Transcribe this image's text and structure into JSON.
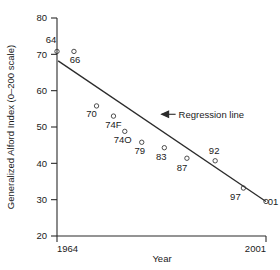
{
  "chart_data": {
    "type": "scatter",
    "title": "",
    "xlabel": "Year",
    "ylabel": "Generalized Alford Index (0–200 scale)",
    "xlim": [
      1964,
      2001
    ],
    "ylim": [
      20,
      80
    ],
    "xticks": [
      1964,
      2001
    ],
    "xtick_labels": [
      "1964",
      "2001"
    ],
    "yticks": [
      20,
      30,
      40,
      50,
      60,
      70,
      80
    ],
    "ytick_labels": [
      "20",
      "30",
      "40",
      "50",
      "60",
      "70",
      "80"
    ],
    "grid": false,
    "legend": "none",
    "points": [
      {
        "label": "64",
        "x": 1964,
        "y": 70.8,
        "label_dx": -6,
        "label_dy": -8
      },
      {
        "label": "66",
        "x": 1967,
        "y": 70.8,
        "label_dx": 1,
        "label_dy": 12
      },
      {
        "label": "70",
        "x": 1971,
        "y": 55.8,
        "label_dx": -5,
        "label_dy": 11
      },
      {
        "label": "74F",
        "x": 1974,
        "y": 53.0,
        "label_dx": 0,
        "label_dy": 12
      },
      {
        "label": "74O",
        "x": 1976,
        "y": 48.8,
        "label_dx": -2,
        "label_dy": 12
      },
      {
        "label": "79",
        "x": 1979,
        "y": 45.8,
        "label_dx": -2,
        "label_dy": 12
      },
      {
        "label": "83",
        "x": 1983,
        "y": 44.3,
        "label_dx": -3,
        "label_dy": 12
      },
      {
        "label": "87",
        "x": 1987,
        "y": 41.4,
        "label_dx": -5,
        "label_dy": 13
      },
      {
        "label": "92",
        "x": 1992,
        "y": 40.7,
        "label_dx": -1,
        "label_dy": -7
      },
      {
        "label": "97",
        "x": 1997,
        "y": 33.2,
        "label_dx": -8,
        "label_dy": 12
      },
      {
        "label": "01",
        "x": 2001,
        "y": 29.5,
        "label_dx": 7,
        "label_dy": 4
      }
    ],
    "regression_line": {
      "x_start": 1964.2,
      "y_start": 68.2,
      "x_end": 2001,
      "y_end": 29.5
    },
    "annotations": [
      {
        "name": "regression-line-annotation",
        "text": "Regression line",
        "x": 1985,
        "y": 53.5
      }
    ]
  },
  "colors": {
    "axis": "#2b2b2b",
    "marker": "#3a3a3a",
    "line": "#2b2b2b",
    "text": "#1a1a1a",
    "background": "#ffffff"
  }
}
